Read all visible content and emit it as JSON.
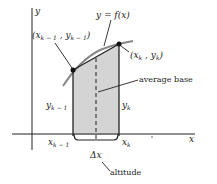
{
  "figure": {
    "axes": {
      "x_label": "x",
      "y_label": "y"
    },
    "curve_label": "y = f(x)",
    "points": {
      "left": {
        "label": "(x",
        "sub1": "k − 1",
        "mid": " , y",
        "sub2": "k − 1",
        "end": ")"
      },
      "right": {
        "label": "(x",
        "sub1": "k",
        "mid": " , y",
        "sub2": "k",
        "end": ")"
      }
    },
    "side_labels": {
      "left_height": "y",
      "left_height_sub": "k − 1",
      "right_height": "y",
      "right_height_sub": "k"
    },
    "tick_labels": {
      "left": "x",
      "left_sub": "k − 1",
      "right": "x",
      "right_sub": "k"
    },
    "annotations": {
      "average_base": "average base",
      "delta_x": "Δx",
      "altitude": "altitude"
    },
    "colors": {
      "fill": "#d4d4d4",
      "line": "#222222",
      "curve": "#888888"
    }
  }
}
